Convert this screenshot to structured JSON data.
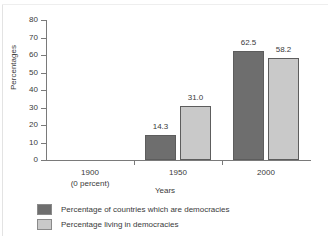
{
  "chart_data": {
    "type": "bar",
    "title": "",
    "xlabel": "Years",
    "ylabel": "Percentages",
    "ylim": [
      0,
      80
    ],
    "yticks": [
      0,
      10,
      20,
      30,
      40,
      50,
      60,
      70,
      80
    ],
    "ytick_labels": [
      "0",
      "10",
      "20",
      "30",
      "40",
      "50",
      "60",
      "70",
      "80"
    ],
    "grid": false,
    "legend_position": "below",
    "categories": [
      "1900",
      "1950",
      "2000"
    ],
    "category_sublabels": [
      "(0 percent)",
      "",
      ""
    ],
    "series": [
      {
        "name": "Percentage of countries which are democracies",
        "color": "#6e6e6e",
        "values": [
          0,
          14.3,
          62.5
        ],
        "value_labels": [
          "",
          "14.3",
          "62.5"
        ]
      },
      {
        "name": "Percentage living in democracies",
        "color": "#c9c9c9",
        "values": [
          0,
          31.0,
          58.2
        ],
        "value_labels": [
          "",
          "31.0",
          "58.2"
        ]
      }
    ]
  },
  "axes": {
    "y_title": "Percentages",
    "x_title": "Years"
  },
  "legend": {
    "items": [
      {
        "label": "Percentage of countries which are democracies",
        "color": "#6e6e6e"
      },
      {
        "label": "Percentage living in democracies",
        "color": "#c9c9c9"
      }
    ]
  },
  "colors": {
    "series_dark": "#6e6e6e",
    "series_light": "#c9c9c9",
    "axis": "#7a7a7a",
    "text": "#3a3a3a",
    "background": "#ffffff"
  }
}
